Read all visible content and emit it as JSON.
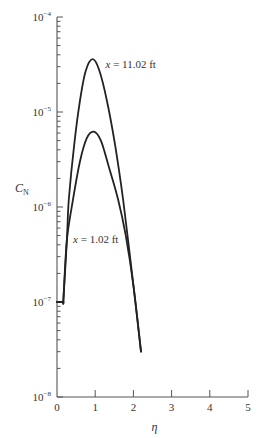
{
  "chart_data": {
    "type": "line",
    "title": "",
    "xlabel": "η",
    "ylabel": {
      "main": "C",
      "sub": "N"
    },
    "xscale": "linear",
    "yscale": "log",
    "xlim": [
      0,
      5
    ],
    "ylim": [
      1e-08,
      0.0001
    ],
    "grid": false,
    "legend": null,
    "x_ticks": [
      {
        "value": 0,
        "label": "0"
      },
      {
        "value": 1,
        "label": "1"
      },
      {
        "value": 2,
        "label": "2"
      },
      {
        "value": 3,
        "label": "3"
      },
      {
        "value": 4,
        "label": "4"
      },
      {
        "value": 5,
        "label": "5"
      }
    ],
    "y_ticks": [
      {
        "value": 0.0001,
        "base": "10",
        "exp": "−4"
      },
      {
        "value": 1e-05,
        "base": "10",
        "exp": "−5"
      },
      {
        "value": 1e-06,
        "base": "10",
        "exp": "−6"
      },
      {
        "value": 1e-07,
        "base": "10",
        "exp": "−7"
      },
      {
        "value": 1e-08,
        "base": "10",
        "exp": "−8"
      }
    ],
    "series": [
      {
        "name": "x = 11.02 ft",
        "x": [
          0.0,
          0.17,
          0.17,
          0.26,
          0.31,
          0.45,
          0.6,
          0.75,
          0.93,
          1.1,
          1.31,
          1.52,
          1.73,
          2.0,
          2.2
        ],
        "y": [
          1e-07,
          1e-07,
          1.1e-07,
          4.5e-07,
          1.2e-06,
          4.5e-06,
          1.3e-05,
          2.7e-05,
          3.6e-05,
          2.8e-05,
          1.3e-05,
          4.5e-06,
          1.2e-06,
          1.5e-07,
          3e-08
        ]
      },
      {
        "name": "x = 1.02 ft",
        "x": [
          0.0,
          0.17,
          0.17,
          0.26,
          0.42,
          0.6,
          0.78,
          0.96,
          1.15,
          1.35,
          1.6,
          1.8,
          2.0,
          2.2
        ],
        "y": [
          1e-07,
          1e-07,
          1.1e-07,
          4.5e-07,
          1.2e-06,
          3e-06,
          5.3e-06,
          6.2e-06,
          5e-06,
          2.7e-06,
          1.2e-06,
          5e-07,
          1.5e-07,
          3e-08
        ]
      }
    ],
    "annotations": [
      {
        "var": "x",
        "text": " = 11.02 ft",
        "x": 1.27,
        "y": 3.2e-05
      },
      {
        "var": "x",
        "text": " = 1.02 ft",
        "x": 0.42,
        "y": 4.6e-07
      }
    ]
  }
}
